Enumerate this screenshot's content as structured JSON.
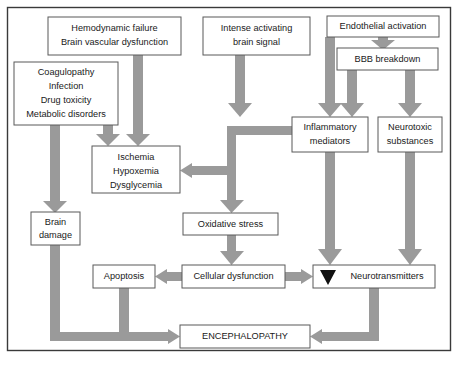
{
  "figure": {
    "type": "flowchart",
    "border_color": "#3a3a3a",
    "arrow_color": "#9a9a9a",
    "box_border_color": "#595959",
    "text_color": "#1a1a1a",
    "background": "#ffffff"
  },
  "nodes": [
    {
      "id": "hemodynamic",
      "lines": [
        "Hemodynamic failure",
        "Brain vascular dysfunction"
      ],
      "x": 48,
      "y": 17,
      "w": 133,
      "h": 38,
      "font": 9.2
    },
    {
      "id": "intense-signal",
      "lines": [
        "Intense activating",
        "brain signal"
      ],
      "x": 203,
      "y": 17,
      "w": 107,
      "h": 38,
      "font": 9.2
    },
    {
      "id": "endothelial",
      "lines": [
        "Endothelial activation"
      ],
      "x": 327,
      "y": 16,
      "w": 112,
      "h": 21,
      "font": 9.2
    },
    {
      "id": "bbb",
      "lines": [
        "BBB breakdown"
      ],
      "x": 337,
      "y": 48,
      "w": 101,
      "h": 22,
      "font": 9.2
    },
    {
      "id": "coagulopathy",
      "lines": [
        "Coagulopathy",
        "Infection",
        "Drug toxicity",
        "Metabolic disorders"
      ],
      "x": 14,
      "y": 62,
      "w": 104,
      "h": 63,
      "font": 9.2
    },
    {
      "id": "inflammatory",
      "lines": [
        "Inflammatory",
        "mediators"
      ],
      "x": 292,
      "y": 117,
      "w": 76,
      "h": 35,
      "font": 9.2
    },
    {
      "id": "neurotoxic",
      "lines": [
        "Neurotoxic",
        "substances"
      ],
      "x": 378,
      "y": 117,
      "w": 64,
      "h": 35,
      "font": 9.2
    },
    {
      "id": "ischemia",
      "lines": [
        "Ischemia",
        "Hypoxemia",
        "Dysglycemia"
      ],
      "x": 92,
      "y": 146,
      "w": 88,
      "h": 47,
      "font": 9.2
    },
    {
      "id": "oxidative",
      "lines": [
        "Oxidative stress"
      ],
      "x": 183,
      "y": 213,
      "w": 95,
      "h": 22,
      "font": 9.2
    },
    {
      "id": "brain-damage",
      "lines": [
        "Brain",
        "damage"
      ],
      "x": 31,
      "y": 212,
      "w": 49,
      "h": 33,
      "font": 9.2
    },
    {
      "id": "apoptosis",
      "lines": [
        "Apoptosis"
      ],
      "x": 93,
      "y": 265,
      "w": 62,
      "h": 23,
      "font": 9.2
    },
    {
      "id": "cellular",
      "lines": [
        "Cellular dysfunction"
      ],
      "x": 182,
      "y": 265,
      "w": 103,
      "h": 23,
      "font": 9.2
    },
    {
      "id": "neurotransmitters",
      "lines": [
        "Neurotransmitters"
      ],
      "x": 313,
      "y": 265,
      "w": 122,
      "h": 23,
      "font": 9.2,
      "prefix_icon": "down-triangle"
    },
    {
      "id": "encephalopathy",
      "lines": [
        "ENCEPHALOPATHY"
      ],
      "x": 180,
      "y": 325,
      "w": 130,
      "h": 23,
      "font": 9.2
    }
  ],
  "edges": [
    {
      "id": "hemodynamic-to-ischemia",
      "from": "hemodynamic",
      "to": "ischemia"
    },
    {
      "id": "coagulopathy-to-ischemia",
      "from": "coagulopathy",
      "to": "ischemia"
    },
    {
      "id": "coagulopathy-to-brain-damage",
      "from": "coagulopathy",
      "to": "brain-damage"
    },
    {
      "id": "intense-signal-to-inflammatory",
      "from": "intense-signal",
      "to": "inflammatory"
    },
    {
      "id": "endothelial-to-bbb",
      "from": "endothelial",
      "to": "bbb"
    },
    {
      "id": "endothelial-to-inflammatory",
      "from": "endothelial",
      "to": "inflammatory"
    },
    {
      "id": "bbb-to-inflammatory",
      "from": "bbb",
      "to": "inflammatory"
    },
    {
      "id": "bbb-to-neurotoxic",
      "from": "bbb",
      "to": "neurotoxic"
    },
    {
      "id": "inflammatory-to-ischemia",
      "from": "inflammatory",
      "to": "ischemia"
    },
    {
      "id": "ischemia-to-oxidative",
      "from": "ischemia",
      "to": "oxidative"
    },
    {
      "id": "oxidative-to-cellular",
      "from": "oxidative",
      "to": "cellular"
    },
    {
      "id": "cellular-to-apoptosis",
      "from": "cellular",
      "to": "apoptosis"
    },
    {
      "id": "cellular-to-neurotransmitters",
      "from": "cellular",
      "to": "neurotransmitters"
    },
    {
      "id": "inflammatory-to-neurotransmitters",
      "from": "inflammatory",
      "to": "neurotransmitters"
    },
    {
      "id": "neurotoxic-to-neurotransmitters",
      "from": "neurotoxic",
      "to": "neurotransmitters"
    },
    {
      "id": "brain-damage-to-encephalopathy",
      "from": "brain-damage",
      "to": "encephalopathy"
    },
    {
      "id": "apoptosis-to-encephalopathy",
      "from": "apoptosis",
      "to": "encephalopathy"
    },
    {
      "id": "neurotransmitters-to-encephalopathy",
      "from": "neurotransmitters",
      "to": "encephalopathy"
    }
  ],
  "caption": {
    "text": ""
  }
}
